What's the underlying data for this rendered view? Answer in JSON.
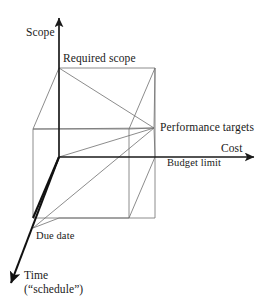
{
  "diagram": {
    "background_color": "#ffffff",
    "line_color": "#6b6b6b",
    "bold_line_color": "#1a1a1a",
    "text_color": "#1a1a1a",
    "axes": [
      {
        "id": "scope",
        "label": "Scope",
        "direction": "up"
      },
      {
        "id": "cost",
        "label": "Cost",
        "direction": "right"
      },
      {
        "id": "time",
        "label": "Time",
        "sublabel": "(“schedule”)",
        "direction": "down-left"
      }
    ],
    "labels": {
      "scope": "Scope",
      "required_scope": "Required scope",
      "performance_targets": "Performance targets",
      "cost": "Cost",
      "budget_limit": "Budget limit",
      "due_date": "Due date",
      "time": "Time",
      "time_sub": "(“schedule”)"
    },
    "nodes": [
      {
        "id": "required-scope",
        "label": "Required scope",
        "x": 59,
        "y": 68
      },
      {
        "id": "performance-targets",
        "label": "Performance targets",
        "x": 154,
        "y": 128
      },
      {
        "id": "budget-limit",
        "label": "Budget limit",
        "x": 155,
        "y": 157
      },
      {
        "id": "due-date",
        "label": "Due date",
        "x": 33,
        "y": 228
      }
    ],
    "geometry": {
      "origin": {
        "x": 59,
        "y": 157
      },
      "scope_axis_tip": {
        "x": 59,
        "y": 14
      },
      "cost_axis_tip": {
        "x": 258,
        "y": 157
      },
      "time_axis_tip": {
        "x": 8,
        "y": 290
      },
      "cube_front_top_left": {
        "x": 59,
        "y": 68
      },
      "cube_front_bottom_left": {
        "x": 59,
        "y": 157
      },
      "cube_front_top_right": {
        "x": 155,
        "y": 68
      },
      "cube_front_bottom_right": {
        "x": 155,
        "y": 157
      },
      "depth_offset": {
        "dx": -26,
        "dy": 61
      }
    }
  }
}
